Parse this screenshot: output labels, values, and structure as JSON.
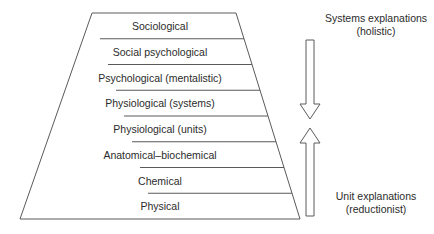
{
  "figure": {
    "stroke_color": "#5a5a5a",
    "text_color": "#2b2b2b",
    "background": "#ffffff"
  },
  "pyramid": {
    "levels": [
      {
        "label": "Sociological"
      },
      {
        "label": "Social psychological"
      },
      {
        "label": "Psychological (mentalistic)"
      },
      {
        "label": "Physiological (systems)"
      },
      {
        "label": "Physiological (units)"
      },
      {
        "label": "Anatomical–biochemical"
      },
      {
        "label": "Chemical"
      },
      {
        "label": "Physical"
      }
    ]
  },
  "annotations": {
    "top": {
      "line1": "Systems explanations",
      "line2": "(holistic)",
      "arrow": "arrow-down"
    },
    "bottom": {
      "line1": "Unit explanations",
      "line2": "(reductionist)",
      "arrow": "arrow-up"
    }
  }
}
